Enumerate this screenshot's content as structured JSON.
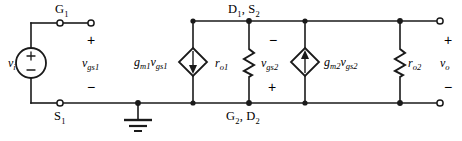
{
  "diagram": {
    "type": "electrical-schematic",
    "canvas": {
      "width": 462,
      "height": 141
    },
    "colors": {
      "background": "#ffffff",
      "wire": "#1a1a1a",
      "label": "#000000"
    }
  },
  "nodes": {
    "gate1": "G₁",
    "source1": "S₁",
    "drain1_source2": "D₁, S₂",
    "gate2_drain2": "G₂, D₂"
  },
  "node_parts": {
    "gate1_base": "G",
    "gate1_sub": "1",
    "source1_base": "S",
    "source1_sub": "1",
    "d1s2_base_a": "D",
    "d1s2_sub_a": "1",
    "d1s2_sep": ", ",
    "d1s2_base_b": "S",
    "d1s2_sub_b": "2",
    "g2d2_base_a": "G",
    "g2d2_sub_a": "2",
    "g2d2_sep": ", ",
    "g2d2_base_b": "D",
    "g2d2_sub_b": "2"
  },
  "sources": {
    "input": {
      "label_base": "v",
      "label_sub": "i",
      "symbol": "independent-voltage-source",
      "plus": "+",
      "minus": "−"
    },
    "dependent1": {
      "label_g": "g",
      "label_g_sub": "m1",
      "label_v": "v",
      "label_v_sub": "gs1",
      "symbol": "dependent-current-source",
      "arrow_direction": "down"
    },
    "dependent2": {
      "label_g": "g",
      "label_g_sub": "m2",
      "label_v": "v",
      "label_v_sub": "gs2",
      "symbol": "dependent-current-source",
      "arrow_direction": "up"
    }
  },
  "resistors": {
    "ro1": {
      "base": "r",
      "sub": "o1"
    },
    "ro2": {
      "base": "r",
      "sub": "o2"
    }
  },
  "voltages": {
    "vgs1": {
      "base": "v",
      "sub": "gs1",
      "top_sign": "+",
      "bottom_sign": "−"
    },
    "vgs2": {
      "base": "v",
      "sub": "gs2",
      "top_sign": "−",
      "bottom_sign": "+"
    },
    "vo": {
      "base": "v",
      "sub": "o",
      "top_sign": "+",
      "bottom_sign": "−"
    }
  },
  "ground": {
    "symbol": "earth-ground"
  }
}
